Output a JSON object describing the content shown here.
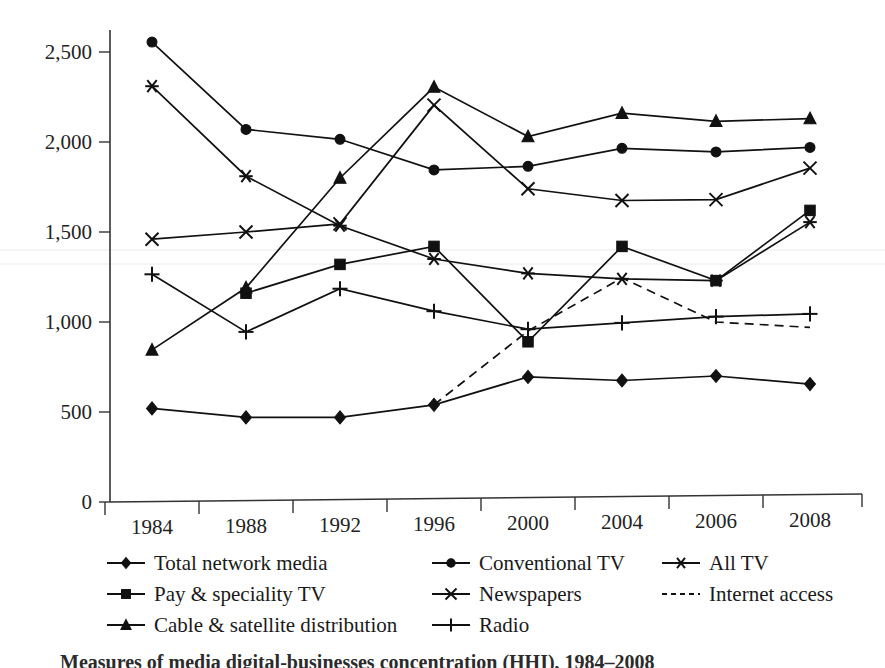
{
  "chart_data": {
    "type": "line",
    "title": "",
    "xlabel": "",
    "ylabel": "",
    "categories": [
      "1984",
      "1988",
      "1992",
      "1996",
      "2000",
      "2004",
      "2006",
      "2008"
    ],
    "ylim": [
      0,
      2750
    ],
    "yticks": [
      0,
      500,
      1000,
      1500,
      2000,
      2500
    ],
    "ytick_labels": [
      "0",
      "500",
      "1,000",
      "1,500",
      "2,000",
      "2,500"
    ],
    "grid": false,
    "legend_position": "below",
    "series": [
      {
        "name": "Total network media",
        "marker": "diamond",
        "style": "solid",
        "values": [
          520,
          470,
          470,
          540,
          695,
          675,
          700,
          655
        ]
      },
      {
        "name": "Conventional TV",
        "marker": "circle",
        "style": "solid",
        "values": [
          2555,
          2070,
          2015,
          1845,
          1865,
          1965,
          1945,
          1970
        ]
      },
      {
        "name": "All TV",
        "marker": "asterisk",
        "style": "solid",
        "values": [
          2310,
          1810,
          1535,
          1350,
          1270,
          1240,
          1230,
          1555
        ]
      },
      {
        "name": "Pay & speciality TV",
        "marker": "square",
        "style": "solid",
        "values": [
          null,
          1160,
          1320,
          1420,
          890,
          1420,
          1230,
          1620
        ]
      },
      {
        "name": "Newspapers",
        "marker": "cross-x",
        "style": "solid",
        "values": [
          1460,
          1500,
          1545,
          2205,
          1740,
          1675,
          1680,
          1855
        ]
      },
      {
        "name": "Internet access",
        "marker": "none",
        "style": "dashed",
        "values": [
          null,
          null,
          null,
          540,
          950,
          1245,
          1000,
          970
        ]
      },
      {
        "name": "Cable & satellite distribution",
        "marker": "triangle",
        "style": "solid",
        "values": [
          845,
          1190,
          1800,
          2305,
          2030,
          2160,
          2115,
          2130
        ]
      },
      {
        "name": "Radio",
        "marker": "plus",
        "style": "solid",
        "values": [
          1265,
          945,
          1185,
          1060,
          960,
          995,
          1030,
          1045
        ]
      }
    ]
  },
  "legend": {
    "items": [
      {
        "label": "Total network media",
        "marker": "diamond",
        "style": "solid"
      },
      {
        "label": "Conventional TV",
        "marker": "circle",
        "style": "solid"
      },
      {
        "label": "All TV",
        "marker": "asterisk",
        "style": "solid"
      },
      {
        "label": "Pay & speciality TV",
        "marker": "square",
        "style": "solid"
      },
      {
        "label": "Newspapers",
        "marker": "cross-x",
        "style": "solid"
      },
      {
        "label": "Internet access",
        "marker": "none",
        "style": "dashed"
      },
      {
        "label": "Cable & satellite distribution",
        "marker": "triangle",
        "style": "solid"
      },
      {
        "label": "Radio",
        "marker": "plus",
        "style": "solid"
      }
    ]
  },
  "caption": {
    "text": "Measures of media digital-businesses concentration (HHI), 1984–2008"
  }
}
